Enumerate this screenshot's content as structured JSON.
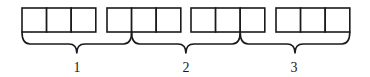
{
  "diagram": {
    "box_groups": [
      {
        "id": "group-a",
        "cell_count": 3
      },
      {
        "id": "group-b",
        "cell_count": 3
      },
      {
        "id": "group-c",
        "cell_count": 3
      },
      {
        "id": "group-d",
        "cell_count": 3
      }
    ],
    "braces": [
      {
        "label": "1",
        "spans_cells": 4
      },
      {
        "label": "2",
        "spans_cells": 4
      },
      {
        "label": "3",
        "spans_cells": 4
      }
    ],
    "colors": {
      "stroke": "#1a1a1a",
      "background": "#ffffff"
    }
  }
}
